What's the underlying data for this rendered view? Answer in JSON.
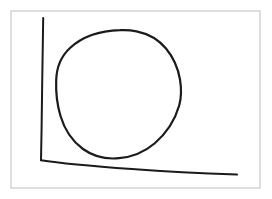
{
  "image": {
    "kind": "hand-drawn-sketch",
    "width": 272,
    "height": 199,
    "background_color": "#ffffff",
    "description": "Hand-drawn sketch of a large closed rounded blob (circle) sitting above and right of two hand-drawn axis lines forming an L shape"
  },
  "frame": {
    "name": "outer-border",
    "color": "#c9c9c9",
    "stroke_width": 1.2,
    "x": 11,
    "y": 11,
    "width": 249,
    "height": 177
  },
  "ink": {
    "color": "#1b1b1b",
    "axis_stroke_width": 2.0,
    "blob_stroke_width": 2.2
  },
  "drawing": {
    "axes": {
      "name": "hand-drawn-axes",
      "origin_corner": [
        41,
        160
      ],
      "vertical_axis": {
        "name": "y-axis-line",
        "start": [
          43,
          18
        ],
        "end": [
          41,
          160
        ],
        "path": "M 43.2 18.0 C 42.6 50.0 42.1 92.0 41.6 128.0 C 41.4 142.0 41.2 152.0 41.0 160.2"
      },
      "horizontal_axis": {
        "name": "x-axis-line",
        "start": [
          41,
          160
        ],
        "end": [
          237,
          175
        ],
        "path": "M 41.0 160.2 C 60.0 163.2 96.0 166.4 132.0 169.0 C 168.0 171.6 205.0 173.4 237.0 174.6"
      }
    },
    "blob": {
      "name": "hand-drawn-circle",
      "closed": true,
      "bounds": {
        "left": 56,
        "right": 181,
        "top": 30,
        "bottom": 158
      },
      "center": [
        118,
        94
      ],
      "path": "M 120.0 30.2 C 100.0 30.8 82.0 37.0 70.0 48.0 C 60.5 56.8 56.6 68.0 56.2 80.0 C 55.7 93.0 57.2 105.0 60.5 116.0 C 64.5 129.4 72.0 141.0 83.0 149.0 C 93.5 156.6 106.5 159.4 119.0 158.2 C 132.0 157.0 144.5 152.0 154.5 143.5 C 166.5 133.2 175.0 120.0 179.2 105.5 C 181.6 96.8 181.4 88.0 180.0 79.5 C 178.0 67.6 173.0 57.0 166.0 48.5 C 158.5 39.4 148.0 33.6 136.5 31.3 C 131.2 30.2 125.6 29.9 120.0 30.2 Z"
    }
  },
  "labels": {
    "axis_label_x": "",
    "axis_label_y": "",
    "title": "",
    "annotations": []
  }
}
